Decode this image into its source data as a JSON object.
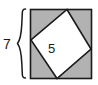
{
  "figure": {
    "type": "geometry-diagram",
    "outer_square": {
      "name": "outer-square",
      "fill_color": "#b2b2b2",
      "stroke_color": "#1a1a1a",
      "side_length_label": "7",
      "bounds": {
        "x": 30,
        "y": 9,
        "width": 62,
        "height": 70
      }
    },
    "inner_square": {
      "name": "inner-tilted-square",
      "fill_color": "#ffffff",
      "stroke_color": "#1a1a1a",
      "side_length_label": "5",
      "vertices": [
        {
          "x": 67,
          "y": 9
        },
        {
          "x": 91,
          "y": 49
        },
        {
          "x": 57,
          "y": 79
        },
        {
          "x": 31,
          "y": 40
        }
      ]
    },
    "brace": {
      "name": "height-brace",
      "orientation": "left",
      "stroke_color": "#1a1a1a",
      "spans_label": "7"
    },
    "labels": {
      "side_length": "7",
      "inner_length": "5"
    }
  }
}
